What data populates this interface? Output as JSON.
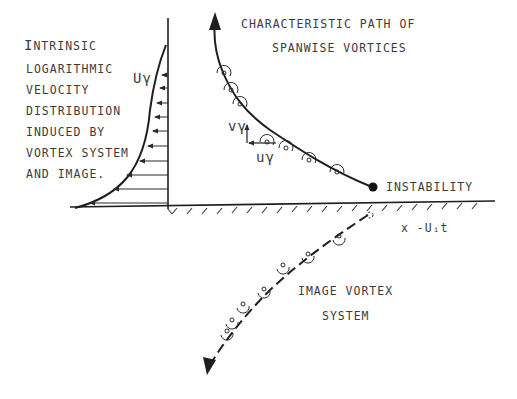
{
  "figure": {
    "type": "vortex-wall-interaction-schematic",
    "colors": {
      "ink": "#1e1e1e",
      "text": "#3c3c3c",
      "background": "#ffffff"
    }
  },
  "labels": {
    "intrinsic_title_initial": "I",
    "intrinsic_title_rest": "NTRINSIC",
    "intrinsic_lines": [
      "LOGARITHMIC",
      "VELOCITY",
      "DISTRIBUTION",
      "INDUCED BY",
      "VORTEX SYSTEM",
      "AND IMAGE."
    ],
    "u_gamma_profile": "Uγ",
    "path_title_line1": "CHARACTERISTIC PATH OF",
    "path_title_line2": "SPANWISE VORTICES",
    "v_gamma": "vγ",
    "u_gamma_vector": "uγ",
    "instability": "INSTABILITY",
    "wall_coordinate": "x -Uᵢt",
    "image_line1": "IMAGE VORTEX",
    "image_line2": "SYSTEM"
  },
  "elements": {
    "velocity_profile_arrows": 10,
    "real_vortex_markers": 7,
    "image_vortex_markers": 7,
    "wall_hatch_marks": 21
  }
}
